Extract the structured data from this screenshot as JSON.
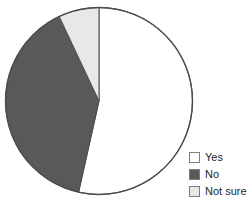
{
  "chart_data": {
    "type": "pie",
    "title": "",
    "categories": [
      "Yes",
      "No",
      "Not sure"
    ],
    "values": [
      53.5,
      39.5,
      7.0
    ],
    "value_unit": "percent",
    "colors": [
      "#ffffff",
      "#595959",
      "#e8e8e8"
    ],
    "start_angle_deg": 0,
    "direction": "clockwise",
    "legend_position": "bottom-right",
    "grid": false,
    "xlabel": "",
    "ylabel": "",
    "slice_edge_color": "#4d4d4d",
    "slices": [
      {
        "label": "Yes",
        "value": 53.5,
        "color": "#ffffff",
        "start_deg": 0,
        "end_deg": 192.6
      },
      {
        "label": "No",
        "value": 39.5,
        "color": "#595959",
        "start_deg": 192.6,
        "end_deg": 334.8
      },
      {
        "label": "Not sure",
        "value": 7.0,
        "color": "#e8e8e8",
        "start_deg": 334.8,
        "end_deg": 360
      }
    ]
  },
  "legend": {
    "items": [
      {
        "label": "Yes",
        "color": "#ffffff"
      },
      {
        "label": "No",
        "color": "#595959"
      },
      {
        "label": "Not sure",
        "color": "#e8e8e8"
      }
    ]
  },
  "figure": {
    "background": "#ffffff",
    "outline_color": "#4d4d4d"
  }
}
